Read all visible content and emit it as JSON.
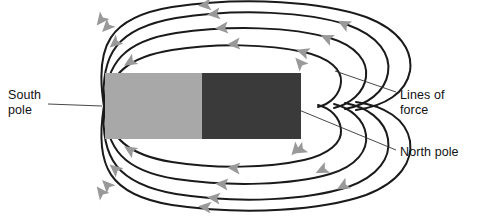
{
  "figure": {
    "kind": "bar-magnet-field-lines-diagram",
    "background_color": "#ffffff"
  },
  "magnet": {
    "south_half": {
      "label": "South pole",
      "color": "#a8a8a8",
      "polarity": "south"
    },
    "north_half": {
      "label": "North pole",
      "color": "#3a3a3a",
      "polarity": "north"
    },
    "rect": {
      "x": 105,
      "y": 73,
      "width": 196,
      "height": 66
    },
    "divider_x": 202
  },
  "labels": {
    "south_pole": {
      "line1": "South",
      "line2": "pole"
    },
    "lines_of_force": {
      "line1": "Lines of",
      "line2": "force"
    },
    "north_pole": {
      "line1": "North pole"
    }
  },
  "field": {
    "line_color": "#1a1a1a",
    "line_width": 2,
    "arrow_color": "#999999",
    "arrow_direction": "left",
    "loop_count_top": 4,
    "loop_count_bottom": 4,
    "south_pole_point": {
      "x": 104,
      "y": 106
    },
    "north_pole_point": {
      "x": 301,
      "y": 106
    }
  },
  "leaders": {
    "color": "#333333",
    "south_pole": {
      "x1": 48,
      "y1": 104,
      "x2": 102,
      "y2": 106
    },
    "lines_of_force": {
      "x1": 396,
      "y1": 92,
      "x2": 335,
      "y2": 71
    },
    "north_pole": {
      "x1": 396,
      "y1": 150,
      "x2": 299,
      "y2": 110
    }
  },
  "chart_data": {
    "type": "diagram",
    "title": "",
    "annotations": [
      "South pole",
      "Lines of force",
      "North pole"
    ]
  }
}
